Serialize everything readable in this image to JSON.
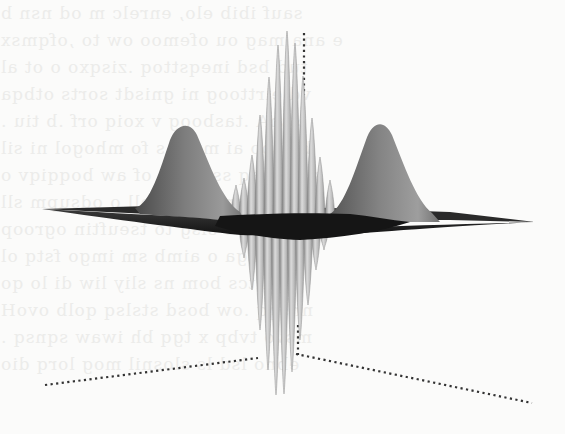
{
  "figure": {
    "type": "3d-surface-plot",
    "colors": {
      "background": "#fbfbfa",
      "sheet_dark": "#1c1c1c",
      "surface_mid": "#8a8a8a",
      "surface_light": "#d6d6d6",
      "axis_dots": "#333333",
      "bleed_text": "#ececea"
    },
    "left_gaussian": {
      "peak": [
        183,
        124
      ],
      "base_left": 135,
      "base_right": 235
    },
    "right_gaussian": {
      "peak": [
        377,
        122
      ],
      "base_left": 330,
      "base_right": 430
    },
    "sheet": {
      "left_tip": [
        42,
        209
      ],
      "right_tip": [
        535,
        222
      ]
    },
    "spikes_up": [
      {
        "x": 236,
        "top": 185
      },
      {
        "x": 244,
        "top": 178
      },
      {
        "x": 252,
        "top": 155
      },
      {
        "x": 260,
        "top": 115
      },
      {
        "x": 269,
        "top": 77
      },
      {
        "x": 278,
        "top": 45
      },
      {
        "x": 287,
        "top": 31
      },
      {
        "x": 295,
        "top": 43
      },
      {
        "x": 303,
        "top": 76
      },
      {
        "x": 312,
        "top": 118
      },
      {
        "x": 320,
        "top": 157
      },
      {
        "x": 330,
        "top": 180
      }
    ],
    "spikes_down": [
      {
        "x": 244,
        "bottom": 258
      },
      {
        "x": 252,
        "bottom": 290
      },
      {
        "x": 260,
        "bottom": 330
      },
      {
        "x": 268,
        "bottom": 370
      },
      {
        "x": 276,
        "bottom": 395
      },
      {
        "x": 284,
        "bottom": 394
      },
      {
        "x": 292,
        "bottom": 372
      },
      {
        "x": 300,
        "bottom": 340
      },
      {
        "x": 308,
        "bottom": 305
      },
      {
        "x": 316,
        "bottom": 270
      },
      {
        "x": 324,
        "bottom": 250
      }
    ],
    "axes": {
      "upper_vertical": {
        "x1": 304,
        "y1": 33,
        "x2": 304,
        "y2": 95
      },
      "lower_vertical": {
        "x1": 298,
        "y1": 325,
        "x2": 298,
        "y2": 355
      },
      "left_axis": {
        "x1": 45,
        "y1": 385,
        "x2": 258,
        "y2": 358
      },
      "right_axis": {
        "x1": 296,
        "y1": 354,
        "x2": 532,
        "y2": 403
      }
    }
  },
  "bleed_through_lines": [
    "sauf ibib elo, enrelc m od nsn b ",
    "e ana mag ou ofemoo ow to ,ofqmsx",
    "tud bsd ineqsttoq .zisqxo o ot al",
    "vd eirttoog ni gnisdt sorts otbqa",
    "ssnA .tasboog v xoiq orf .b tiu .",
    "baisoo ai mtoq s fo mhogol ni sil",
    "s ot seaq ssocoos of aw boqqiqv o",
    "suov ,bsmim too oll o odsupm sll",
    "ssonts o sisg to tseuftin ogroop",
    "ebosnga o aimb sm imgo fstq ol",
    "gnitcs bom ns sliy liw di lo qo",
    "nnsqq .ow bosd stslsq qolb ovoH",
    "msvo tvbp x tgq bh iwaw sqnsq .",
    "ebno lsd ls slosnil mog lorq dio"
  ]
}
